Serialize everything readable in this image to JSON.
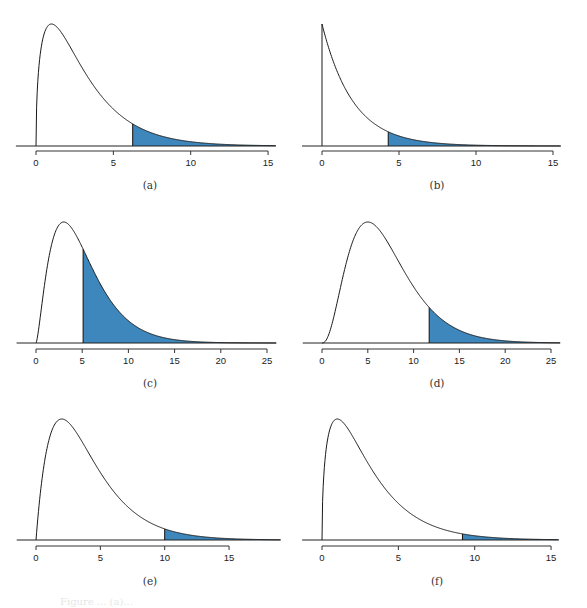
{
  "figure": {
    "shade_color": "#3d87bd",
    "curve_color": "#1a1a1a",
    "axis_color": "#333333",
    "footer_text": "Figure ... (a)..."
  },
  "chart_data": [
    {
      "id": "a",
      "type": "area",
      "caption": "(a)",
      "distribution": "chi-square",
      "df": 3,
      "shade_from": 6.25,
      "xlim": [
        0,
        15.5
      ],
      "xticks": [
        0,
        5,
        10,
        15
      ],
      "xtick_labels": [
        "0",
        "5",
        "10",
        "15"
      ],
      "baseline_extent": [
        -1.3,
        15.5
      ],
      "grid": false,
      "legend": null,
      "title": "",
      "xlabel": "",
      "ylabel": ""
    },
    {
      "id": "b",
      "type": "area",
      "caption": "(b)",
      "distribution": "chi-square",
      "df": 2,
      "shade_from": 4.3,
      "xlim": [
        0,
        15.5
      ],
      "xticks": [
        0,
        5,
        10,
        15
      ],
      "xtick_labels": [
        "0",
        "5",
        "10",
        "15"
      ],
      "baseline_extent": [
        -1.3,
        15.5
      ],
      "grid": false,
      "legend": null,
      "title": "",
      "xlabel": "",
      "ylabel": ""
    },
    {
      "id": "c",
      "type": "area",
      "caption": "(c)",
      "distribution": "chi-square",
      "df": 5,
      "shade_from": 5.1,
      "xlim": [
        0,
        26
      ],
      "xticks": [
        0,
        5,
        10,
        15,
        20,
        25
      ],
      "xtick_labels": [
        "0",
        "5",
        "10",
        "15",
        "20",
        "25"
      ],
      "baseline_extent": [
        -2.1,
        26
      ],
      "grid": false,
      "legend": null,
      "title": "",
      "xlabel": "",
      "ylabel": ""
    },
    {
      "id": "d",
      "type": "area",
      "caption": "(d)",
      "distribution": "chi-square",
      "df": 7,
      "shade_from": 11.7,
      "xlim": [
        0,
        26
      ],
      "xticks": [
        0,
        5,
        10,
        15,
        20,
        25
      ],
      "xtick_labels": [
        "0",
        "5",
        "10",
        "15",
        "20",
        "25"
      ],
      "baseline_extent": [
        -2.1,
        26
      ],
      "grid": false,
      "legend": null,
      "title": "",
      "xlabel": "",
      "ylabel": ""
    },
    {
      "id": "e",
      "type": "area",
      "caption": "(e)",
      "distribution": "chi-square",
      "df": 4,
      "shade_from": 10.0,
      "xlim": [
        0,
        19
      ],
      "xticks": [
        0,
        5,
        10,
        15
      ],
      "xtick_labels": [
        "0",
        "5",
        "10",
        "15"
      ],
      "baseline_extent": [
        -1.5,
        19
      ],
      "grid": false,
      "legend": null,
      "title": "",
      "xlabel": "",
      "ylabel": ""
    },
    {
      "id": "f",
      "type": "area",
      "caption": "(f)",
      "distribution": "chi-square",
      "df": 3,
      "shade_from": 9.2,
      "xlim": [
        0,
        15.5
      ],
      "xticks": [
        0,
        5,
        10,
        15
      ],
      "xtick_labels": [
        "0",
        "5",
        "10",
        "15"
      ],
      "baseline_extent": [
        -1.3,
        15.5
      ],
      "grid": false,
      "legend": null,
      "title": "",
      "xlabel": "",
      "ylabel": ""
    }
  ],
  "layout": {
    "panels": [
      {
        "id": "a",
        "left": 0,
        "top": 0,
        "x0px": 36,
        "x_unit_px": 15.47,
        "baseline_y": 146,
        "peak_y": 24,
        "axis_y": 151,
        "label_y": 166,
        "caption_y": 189,
        "caption_x": 150
      },
      {
        "id": "b",
        "left": 0,
        "top": 0,
        "x0px": 322,
        "x_unit_px": 15.4,
        "baseline_y": 146,
        "peak_y": 24,
        "axis_y": 151,
        "label_y": 166,
        "caption_y": 189,
        "caption_x": 437
      },
      {
        "id": "c",
        "left": 0,
        "top": 0,
        "x0px": 36,
        "x_unit_px": 9.24,
        "baseline_y": 343,
        "peak_y": 222,
        "axis_y": 349,
        "label_y": 364,
        "caption_y": 387,
        "caption_x": 150
      },
      {
        "id": "d",
        "left": 0,
        "top": 0,
        "x0px": 322,
        "x_unit_px": 9.16,
        "baseline_y": 343,
        "peak_y": 222,
        "axis_y": 349,
        "label_y": 364,
        "caption_y": 387,
        "caption_x": 437
      },
      {
        "id": "e",
        "left": 0,
        "top": 0,
        "x0px": 36,
        "x_unit_px": 12.87,
        "baseline_y": 540,
        "peak_y": 419,
        "axis_y": 546,
        "label_y": 561,
        "caption_y": 585,
        "caption_x": 150
      },
      {
        "id": "f",
        "left": 0,
        "top": 0,
        "x0px": 322,
        "x_unit_px": 15.27,
        "baseline_y": 540,
        "peak_y": 419,
        "axis_y": 546,
        "label_y": 561,
        "caption_y": 585,
        "caption_x": 437
      }
    ]
  }
}
